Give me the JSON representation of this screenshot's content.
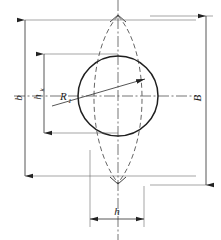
{
  "diagram": {
    "type": "engineering-dimension-drawing",
    "background_color": "#ffffff",
    "line_color": "#2b2b2b",
    "dashed_color": "#4a4a4a",
    "centerline_color": "#3a3a3a",
    "labels": {
      "overall_height_left": "b",
      "partial_height": "h",
      "partial_height_subscript": "k",
      "radius": "R",
      "radius_subscript": "1",
      "overall_height_right": "B",
      "width_bottom": "h"
    },
    "geometry": {
      "circle": {
        "center_x": 118,
        "center_y": 96,
        "radius": 40
      },
      "lens": {
        "apex_top_y": 16,
        "apex_bottom_y": 183,
        "center_x": 118,
        "half_width": 34
      },
      "centerline_vertical_x": 118,
      "centerline_horizontal_y": 96
    },
    "dimensions": [
      {
        "name": "b",
        "orientation": "vertical",
        "axis_x": 25,
        "from_y": 20,
        "to_y": 176,
        "label": "b"
      },
      {
        "name": "h_k",
        "orientation": "vertical",
        "axis_x": 44,
        "from_y": 54,
        "to_y": 133,
        "label": "h",
        "subscript": "k"
      },
      {
        "name": "B",
        "orientation": "vertical",
        "axis_x": 206,
        "from_y": 16,
        "to_y": 185,
        "label": "B"
      },
      {
        "name": "h",
        "orientation": "horizontal",
        "axis_y": 219,
        "from_x": 90,
        "to_x": 144,
        "label": "h"
      },
      {
        "name": "R1",
        "orientation": "radial-leader",
        "label": "R",
        "subscript": "1"
      }
    ]
  }
}
